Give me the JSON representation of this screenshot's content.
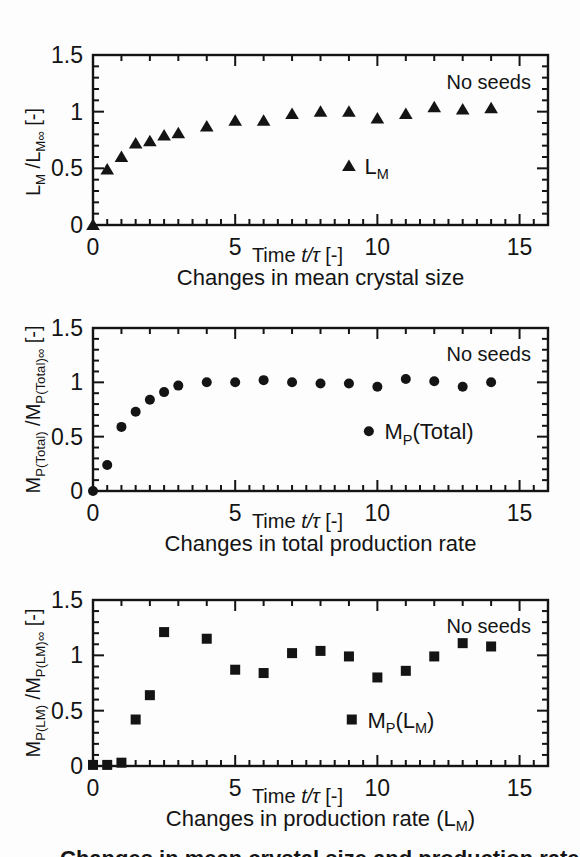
{
  "figure": {
    "ink_color": "#141414",
    "background_color": "#fdfdfd",
    "cutoff_caption": "Changes in mean crystal size and production rate (N"
  },
  "chart_data": [
    {
      "type": "scatter",
      "id": "mean-crystal-size",
      "marker": "triangle",
      "marker_color": "#111111",
      "title": "Changes in mean crystal size",
      "xlabel": "Time  t/τ  [-]",
      "xlabel_rich": [
        {
          "t": "Time  "
        },
        {
          "t": "t/τ",
          "i": true
        },
        {
          "t": "  [-]"
        }
      ],
      "ylabel": "L_M /L_M∞ [-]",
      "ylabel_rich": [
        {
          "t": "L"
        },
        {
          "t": "M",
          "sub": true
        },
        {
          "t": " /L"
        },
        {
          "t": "M∞",
          "sub": true
        },
        {
          "t": " [-]"
        }
      ],
      "annotation": "No seeds",
      "legend_label": "L_M",
      "legend_rich": [
        {
          "t": "L"
        },
        {
          "t": "M",
          "sub": true
        }
      ],
      "legend_pos": {
        "x": 9.0,
        "y": 0.52
      },
      "xlim": [
        0,
        16
      ],
      "ylim": [
        0,
        1.5
      ],
      "xticks": [
        0,
        5,
        10,
        15
      ],
      "xtick_labels": [
        "0",
        "5",
        "10",
        "15"
      ],
      "yticks": [
        0,
        0.5,
        1,
        1.5
      ],
      "ytick_labels": [
        "0",
        "0.5",
        "1",
        "1.5"
      ],
      "x": [
        0,
        0.5,
        1,
        1.5,
        2,
        2.5,
        3,
        4,
        5,
        6,
        7,
        8,
        9,
        10,
        11,
        12,
        13,
        14
      ],
      "y": [
        0,
        0.49,
        0.6,
        0.72,
        0.74,
        0.79,
        0.81,
        0.87,
        0.92,
        0.92,
        0.98,
        1.0,
        1.0,
        0.94,
        0.98,
        1.04,
        1.02,
        1.03
      ]
    },
    {
      "type": "scatter",
      "id": "total-production-rate",
      "marker": "circle",
      "marker_color": "#111111",
      "title": "Changes in total production rate",
      "xlabel": "Time  t/τ  [-]",
      "xlabel_rich": [
        {
          "t": "Time  "
        },
        {
          "t": "t/τ",
          "i": true
        },
        {
          "t": "  [-]"
        }
      ],
      "ylabel": "M_P(Total) /M_P(Total)∞ [-]",
      "ylabel_rich": [
        {
          "t": "M"
        },
        {
          "t": "P(Total)",
          "sub": true
        },
        {
          "t": " /M"
        },
        {
          "t": "P(Total)∞",
          "sub": true
        },
        {
          "t": " [-]"
        }
      ],
      "annotation": "No seeds",
      "legend_label": "M_P(Total)",
      "legend_rich": [
        {
          "t": "M"
        },
        {
          "t": "P",
          "sub": true
        },
        {
          "t": "(Total)"
        }
      ],
      "legend_pos": {
        "x": 9.7,
        "y": 0.55
      },
      "xlim": [
        0,
        16
      ],
      "ylim": [
        0,
        1.5
      ],
      "xticks": [
        0,
        5,
        10,
        15
      ],
      "xtick_labels": [
        "0",
        "5",
        "10",
        "15"
      ],
      "yticks": [
        0,
        0.5,
        1,
        1.5
      ],
      "ytick_labels": [
        "0",
        "0.5",
        "1",
        "1.5"
      ],
      "x": [
        0,
        0.5,
        1,
        1.5,
        2,
        2.5,
        3,
        4,
        5,
        6,
        7,
        8,
        9,
        10,
        11,
        12,
        13,
        14
      ],
      "y": [
        0,
        0.24,
        0.59,
        0.73,
        0.84,
        0.91,
        0.97,
        1.0,
        1.0,
        1.02,
        1.0,
        0.99,
        0.99,
        0.96,
        1.03,
        1.01,
        0.96,
        1.0
      ]
    },
    {
      "type": "scatter",
      "id": "production-rate-lm",
      "marker": "square",
      "marker_color": "#111111",
      "title": "Changes in production rate (L_M)",
      "title_rich": [
        {
          "t": "Changes in production rate (L"
        },
        {
          "t": "M",
          "sub": true
        },
        {
          "t": ")"
        }
      ],
      "xlabel": "Time  t/τ  [-]",
      "xlabel_rich": [
        {
          "t": "Time  "
        },
        {
          "t": "t/τ",
          "i": true
        },
        {
          "t": "  [-]"
        }
      ],
      "ylabel": "M_P(LM) /M_P(LM)∞ [-]",
      "ylabel_rich": [
        {
          "t": "M"
        },
        {
          "t": "P(LM)",
          "sub": true
        },
        {
          "t": " /M"
        },
        {
          "t": "P(LM)∞",
          "sub": true
        },
        {
          "t": " [-]"
        }
      ],
      "annotation": "No seeds",
      "legend_label": "M_P(L_M)",
      "legend_rich": [
        {
          "t": "M"
        },
        {
          "t": "P",
          "sub": true
        },
        {
          "t": "(L"
        },
        {
          "t": "M",
          "sub": true
        },
        {
          "t": ")"
        }
      ],
      "legend_pos": {
        "x": 9.1,
        "y": 0.42
      },
      "xlim": [
        0,
        16
      ],
      "ylim": [
        0,
        1.5
      ],
      "xticks": [
        0,
        5,
        10,
        15
      ],
      "xtick_labels": [
        "0",
        "5",
        "10",
        "15"
      ],
      "yticks": [
        0,
        0.5,
        1,
        1.5
      ],
      "ytick_labels": [
        "0",
        "0.5",
        "1",
        "1.5"
      ],
      "x": [
        0,
        0.5,
        1,
        1.5,
        2,
        2.5,
        4,
        5,
        6,
        7,
        8,
        9,
        10,
        11,
        12,
        13,
        14
      ],
      "y": [
        0.01,
        0.01,
        0.03,
        0.42,
        0.64,
        1.21,
        1.15,
        0.87,
        0.84,
        1.02,
        1.04,
        0.99,
        0.8,
        0.86,
        0.99,
        1.11,
        1.08
      ]
    }
  ]
}
